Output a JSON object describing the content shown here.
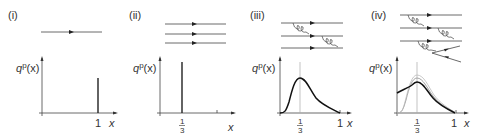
{
  "figure": {
    "panels": [
      {
        "label": "(i)",
        "ylabel_main": "q",
        "ylabel_sup": "p",
        "ylabel_tail": "(x)",
        "xlabel": "x",
        "tick_one": "1",
        "quark_lines": 1,
        "description": "single quark: delta spike at x = 1"
      },
      {
        "label": "(ii)",
        "ylabel_main": "q",
        "ylabel_sup": "p",
        "ylabel_tail": "(x)",
        "xlabel": "x",
        "tick_num": "1",
        "tick_den": "3",
        "quark_lines": 3,
        "description": "three free quarks: delta spike at x = 1/3"
      },
      {
        "label": "(iii)",
        "ylabel_main": "q",
        "ylabel_sup": "p",
        "ylabel_tail": "(x)",
        "xlabel": "x",
        "tick_num": "1",
        "tick_den": "3",
        "tick_one": "1",
        "quark_lines": 3,
        "gluons": 2,
        "description": "three interacting quarks: smeared peak around x = 1/3"
      },
      {
        "label": "(iv)",
        "ylabel_main": "q",
        "ylabel_sup": "p",
        "ylabel_tail": "(x)",
        "xlabel": "x",
        "tick_num": "1",
        "tick_den": "3",
        "tick_one": "1",
        "quark_lines": 3,
        "gluons": 3,
        "sea_pair": true,
        "description": "with sea quarks: peak near 1/3 plus rise at small x"
      }
    ]
  }
}
